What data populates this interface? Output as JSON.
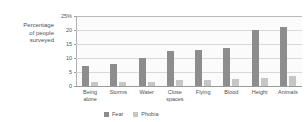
{
  "chart_data": {
    "type": "bar",
    "title": "",
    "xlabel": "",
    "ylabel": "Percentage of people surveyed",
    "ylim": [
      0,
      25
    ],
    "grid": true,
    "legend_position": "bottom",
    "categories": [
      "Being alone",
      "Storms",
      "Water",
      "Close spaces",
      "Flying",
      "Blood",
      "Height",
      "Animals"
    ],
    "ytick_labels": [
      "25%",
      "20",
      "15",
      "10",
      "5",
      "0"
    ],
    "ytick_values": [
      25,
      20,
      15,
      10,
      5,
      0
    ],
    "series": [
      {
        "name": "Fear",
        "color": "#8d8d8d",
        "values": [
          7,
          8,
          10,
          12.5,
          13,
          13.5,
          20,
          21
        ]
      },
      {
        "name": "Phobia",
        "color": "#c6c6c6",
        "values": [
          1.5,
          1.5,
          1.5,
          2,
          2,
          2.5,
          3,
          3.5
        ]
      }
    ]
  },
  "axis": {
    "y_title_line1": "Percentage",
    "y_title_line2": "of people",
    "y_title_line3": "surveyed"
  }
}
